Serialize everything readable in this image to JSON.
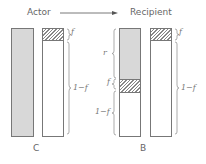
{
  "header": {
    "actor_label": "Actor",
    "recipient_label": "Recipient"
  },
  "panels": [
    {
      "label": "C",
      "bars": [
        {
          "segments": [
            {
              "type": "grey",
              "fraction": 1.0
            }
          ]
        },
        {
          "segments": [
            {
              "type": "hatched",
              "label": "f"
            },
            {
              "type": "white",
              "label": "1−f"
            }
          ]
        }
      ]
    },
    {
      "label": "B",
      "bars": [
        {
          "segments": [
            {
              "type": "grey",
              "label": "r"
            },
            {
              "type": "hatched",
              "label": "f"
            },
            {
              "type": "white",
              "label": "1−f"
            }
          ]
        },
        {
          "segments": [
            {
              "type": "hatched",
              "label": "f"
            },
            {
              "type": "white",
              "label": "1−f"
            }
          ]
        }
      ]
    }
  ],
  "braces": {
    "c_f": "f",
    "c_1mf": "1−f",
    "b_r": "r",
    "b_f": "f",
    "b_1mf": "1−f",
    "b2_f": "f",
    "b2_1mf": "1−f"
  },
  "colors": {
    "grey_fill": "#d8d8d8",
    "outline": "#777777"
  }
}
